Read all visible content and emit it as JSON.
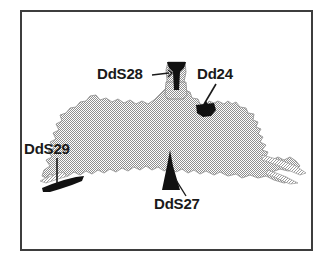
{
  "figure": {
    "type": "site-location-map",
    "frame": {
      "border_color": "#3d3d3d",
      "background_color": "#ffffff"
    },
    "landmass": {
      "name": "shaded-landform",
      "fill_style": "dithered-gray-halftone",
      "fill_color": "#9a9a9a",
      "outline_color": "#808080"
    },
    "marker_color": "#111111",
    "leader_line_color": "#1a1a1a"
  },
  "labels": {
    "dds28": "DdS28",
    "dd24": "Dd24",
    "dds29": "DdS29",
    "dds27": "DdS27"
  },
  "markers": [
    {
      "id": "dds28",
      "label": "DdS28",
      "shape": "funnel",
      "leader": "horizontal-right"
    },
    {
      "id": "dd24",
      "label": "Dd24",
      "shape": "crescent-blob",
      "leader": "diagonal-arrow-down-left"
    },
    {
      "id": "dds29",
      "label": "DdS29",
      "shape": "crescent-sliver",
      "leader": "vertical-down"
    },
    {
      "id": "dds27",
      "label": "DdS27",
      "shape": "spike",
      "leader": "diagonal-up-left"
    }
  ]
}
